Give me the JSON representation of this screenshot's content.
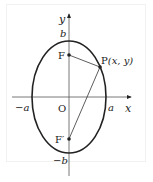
{
  "diagram": {
    "type": "ellipse-with-foci",
    "axes": {
      "x_label": "x",
      "y_label": "y",
      "origin_label": "O"
    },
    "vertices": {
      "neg_a": "−a",
      "pos_a": "a",
      "pos_b": "b",
      "neg_b": "−b"
    },
    "foci": {
      "upper": "F",
      "lower": "F′"
    },
    "point": {
      "name": "P",
      "coords": "(x,  y)"
    },
    "colors": {
      "stroke": "#222222",
      "background": "#ffffff",
      "frame": "#f1f1f1"
    }
  }
}
